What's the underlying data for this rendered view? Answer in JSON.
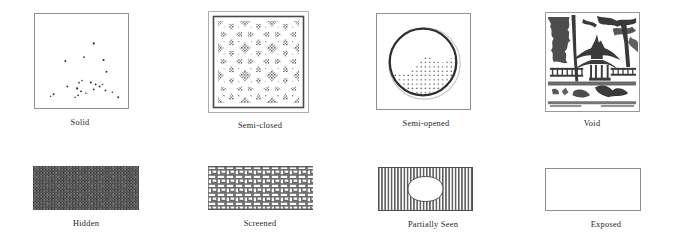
{
  "figure": {
    "rows": [
      {
        "row_name": "visual-openness-row",
        "cells": [
          {
            "key": "solid",
            "caption": "Solid",
            "art_name": "solid-wall-sparse-dots-panel",
            "icon": "square-outline-sparse-stipple-icon",
            "description": "Thin grey square outline, almost empty, a few scattered dark specks in the lower half"
          },
          {
            "key": "semi_closed",
            "caption": "Semi-closed",
            "art_name": "semi-closed-lattice-window-panel",
            "icon": "square-frame-floral-lattice-icon",
            "description": "Double square frame filled with an interlocking circular floral lattice, dense grey fill between the tracery"
          },
          {
            "key": "semi_opened",
            "caption": "Semi-opened",
            "art_name": "semi-opened-moon-gate-panel",
            "icon": "square-frame-with-circle-and-stipple-icon",
            "description": "Square outline containing a heavy dark circle (moon gate) with stippled dots across the lower part of the opening"
          },
          {
            "key": "void",
            "caption": "Void",
            "art_name": "void-garden-scene-panel",
            "icon": "garden-pavilion-woodcut-icon",
            "description": "Woodcut-style Chinese garden scene: pavilion with curved roof, trees, balustrade, water and rocks"
          }
        ]
      },
      {
        "row_name": "visibility-row",
        "cells": [
          {
            "key": "hidden",
            "caption": "Hidden",
            "art_name": "hidden-solid-dark-band",
            "icon": "dark-noise-rectangle-icon",
            "description": "Horizontal rectangle filled with dense dark grey noise, no border"
          },
          {
            "key": "screened",
            "caption": "Screened",
            "art_name": "screened-basket-weave-band",
            "icon": "basket-weave-rectangle-icon",
            "description": "Horizontal rectangle filled with a grey basket-weave / brick lattice pattern"
          },
          {
            "key": "partially_seen",
            "caption": "Partially Seen",
            "art_name": "partially-seen-striped-band-with-opening",
            "icon": "vertical-stripes-with-oval-aperture-icon",
            "description": "Horizontal rectangle of fine vertical stripes with a white rounded oval aperture in the centre"
          },
          {
            "key": "exposed",
            "caption": "Exposed",
            "art_name": "exposed-empty-band",
            "icon": "empty-outlined-rectangle-icon",
            "description": "Empty horizontal rectangle with a thin grey outline"
          }
        ]
      }
    ]
  },
  "colors": {
    "background": "#ffffff",
    "outline": "#8f9093",
    "ink": "#201f1f",
    "pattern_dark": "#4f4f4f",
    "pattern_mid": "#6e6e6e",
    "pattern_light": "#a8a8a8"
  }
}
